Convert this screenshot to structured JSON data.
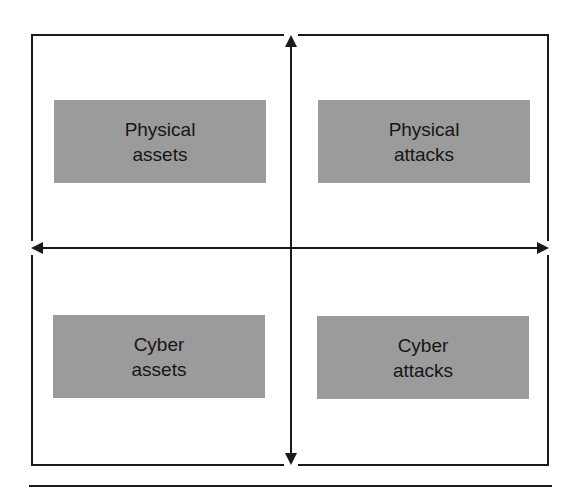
{
  "diagram": {
    "type": "2x2 quadrant matrix",
    "colors": {
      "box_fill": "#9b9b9b",
      "line": "#1a1a1a",
      "background": "#ffffff",
      "text": "#161616"
    },
    "axes": {
      "vertical": {
        "arrowheads": [
          "top",
          "bottom"
        ]
      },
      "horizontal": {
        "arrowheads": [
          "left",
          "right"
        ]
      }
    },
    "quadrants": [
      {
        "position": "top-left",
        "label": "Physical\nassets"
      },
      {
        "position": "top-right",
        "label": "Physical\nattacks"
      },
      {
        "position": "bottom-left",
        "label": "Cyber\nassets"
      },
      {
        "position": "bottom-right",
        "label": "Cyber\nattacks"
      }
    ]
  }
}
